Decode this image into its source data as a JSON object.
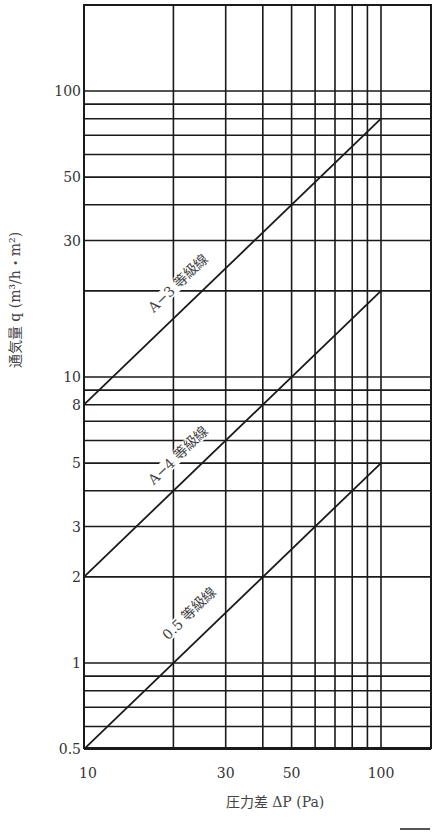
{
  "chart_data": {
    "type": "line",
    "scale": {
      "x": "log",
      "y": "log"
    },
    "title": "",
    "xlabel": "圧力差 ΔP (Pa)",
    "ylabel": "通気量 q (m³/h・m²)",
    "xlim": [
      10,
      100
    ],
    "ylim": [
      0.5,
      150
    ],
    "x_ticks": [
      {
        "value": 10,
        "label": "10"
      },
      {
        "value": 30,
        "label": "30"
      },
      {
        "value": 50,
        "label": "50"
      },
      {
        "value": 100,
        "label": "100"
      }
    ],
    "y_ticks": [
      {
        "value": 0.5,
        "label": "0.5"
      },
      {
        "value": 1,
        "label": "1"
      },
      {
        "value": 2,
        "label": "2"
      },
      {
        "value": 3,
        "label": "3"
      },
      {
        "value": 5,
        "label": "5"
      },
      {
        "value": 8,
        "label": "8"
      },
      {
        "value": 10,
        "label": "10"
      },
      {
        "value": 30,
        "label": "30"
      },
      {
        "value": 50,
        "label": "50"
      },
      {
        "value": 100,
        "label": "100"
      }
    ],
    "x_gridlines": [
      10,
      20,
      30,
      40,
      50,
      60,
      70,
      80,
      90,
      100
    ],
    "y_gridlines": [
      0.5,
      0.6,
      0.7,
      0.8,
      0.9,
      1,
      2,
      3,
      4,
      5,
      6,
      7,
      8,
      9,
      10,
      20,
      30,
      40,
      50,
      60,
      70,
      80,
      90,
      100
    ],
    "grid": true,
    "legend": "none (lines labeled inline)",
    "series": [
      {
        "name": "A−3 等級線",
        "label": "A−3 等級線",
        "x": [
          10,
          100
        ],
        "y": [
          8,
          80
        ]
      },
      {
        "name": "A−4 等級線",
        "label": "A−4 等級線",
        "x": [
          10,
          100
        ],
        "y": [
          2,
          20
        ]
      },
      {
        "name": "0.5 等級線",
        "label": "0.5 等級線",
        "x": [
          10,
          100
        ],
        "y": [
          0.5,
          5
        ]
      }
    ]
  }
}
